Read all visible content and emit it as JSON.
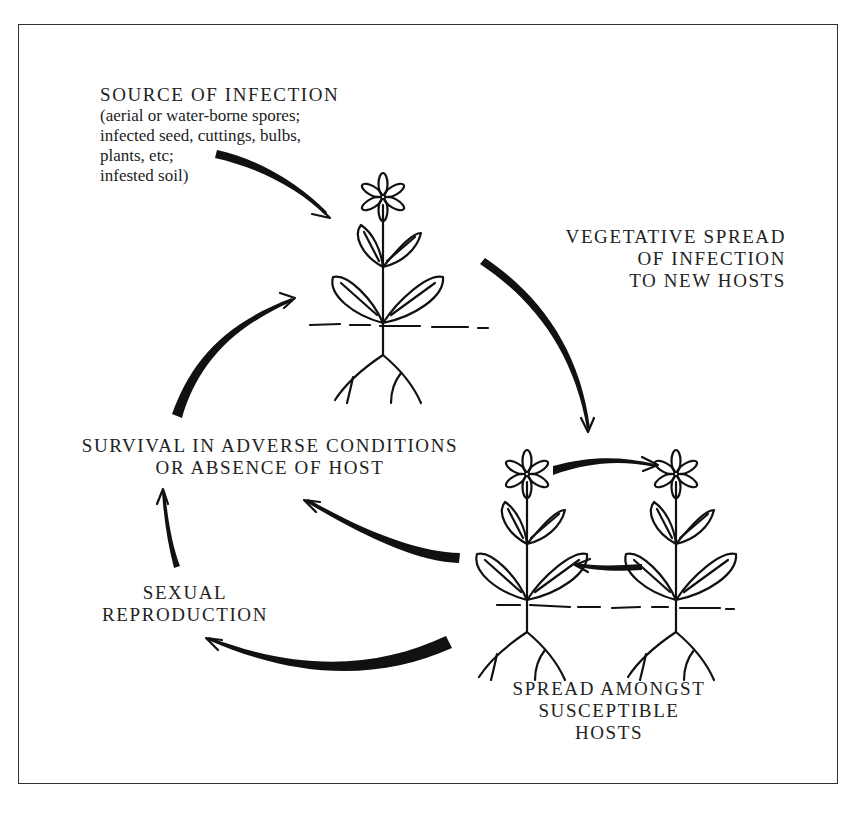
{
  "diagram": {
    "type": "cycle",
    "nodes": {
      "source": {
        "heading": "SOURCE OF INFECTION",
        "details": [
          "(aerial or water-borne spores;",
          "infected seed, cuttings, bulbs,",
          "plants, etc;",
          "infested soil)"
        ]
      },
      "vegetative": {
        "lines": [
          "VEGETATIVE SPREAD",
          "OF INFECTION",
          "TO NEW HOSTS"
        ]
      },
      "survival": {
        "lines": [
          "SURVIVAL IN ADVERSE CONDITIONS",
          "OR ABSENCE OF HOST"
        ]
      },
      "sexual": {
        "lines": [
          "SEXUAL",
          "REPRODUCTION"
        ]
      },
      "spread": {
        "lines": [
          "SPREAD AMONGST",
          "SUSCEPTIBLE",
          "HOSTS"
        ]
      }
    },
    "edges": [
      {
        "from": "source",
        "to": "plant-host"
      },
      {
        "from": "plant-host",
        "to": "infected-plants"
      },
      {
        "from": "infected-plant-left",
        "to": "infected-plant-right"
      },
      {
        "from": "infected-plant-right",
        "to": "infected-plant-left"
      },
      {
        "from": "infected-plants",
        "to": "survival"
      },
      {
        "from": "infected-plants",
        "to": "sexual"
      },
      {
        "from": "sexual",
        "to": "survival"
      },
      {
        "from": "survival",
        "to": "plant-host"
      }
    ],
    "illustrations": [
      "plant-host",
      "infected-plant-left",
      "infected-plant-right"
    ]
  }
}
